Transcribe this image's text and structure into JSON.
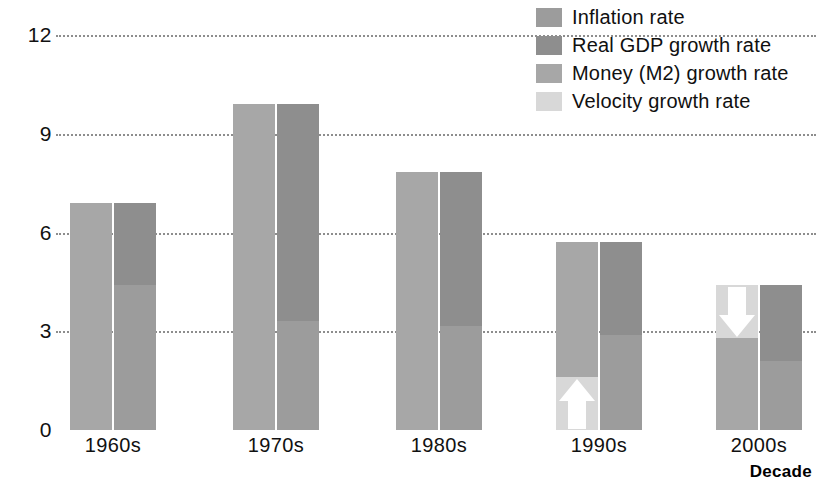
{
  "chart_data": {
    "type": "bar",
    "title": "",
    "subtitle": "",
    "xlabel": "Decade",
    "ylabel": "",
    "categories": [
      "1960s",
      "1970s",
      "1980s",
      "1990s",
      "2000s"
    ],
    "ylim": [
      0,
      12
    ],
    "yticks": [
      0,
      3,
      6,
      9,
      12
    ],
    "ytick_labels": [
      "0",
      "3",
      "6",
      "9",
      "12"
    ],
    "grid": true,
    "grid_style": "dotted horizontal",
    "legend_position": "top-right",
    "note": "Paired stacked bars per decade. Left bar = Money (M2) growth rate, optionally split with Velocity growth rate. Right bar = Real GDP growth rate stacked on Inflation rate.",
    "series": [
      {
        "name": "Money (M2) growth rate",
        "color": "#a7a7a7",
        "bar": "left",
        "values": [
          6.9,
          9.9,
          7.85,
          5.7,
          4.4
        ]
      },
      {
        "name": "Velocity growth rate",
        "color": "#d8d8d8",
        "bar": "left",
        "values": [
          0,
          0,
          0,
          1.6,
          1.6
        ],
        "placement": [
          "none",
          "none",
          "none",
          "bottom",
          "top"
        ],
        "arrows": [
          "none",
          "none",
          "none",
          "up",
          "down"
        ]
      },
      {
        "name": "Inflation rate",
        "color": "#9c9c9c",
        "bar": "right",
        "stack": "bottom",
        "values": [
          4.4,
          3.3,
          3.15,
          2.9,
          2.1
        ]
      },
      {
        "name": "Real GDP growth rate",
        "color": "#8e8e8e",
        "bar": "right",
        "stack": "top",
        "values": [
          2.5,
          6.6,
          4.7,
          2.8,
          2.3
        ]
      }
    ],
    "right_bar_totals": [
      6.9,
      9.9,
      7.85,
      5.7,
      4.4
    ]
  },
  "legend": {
    "items": [
      {
        "label": "Inflation rate",
        "color": "#9c9c9c"
      },
      {
        "label": "Real GDP growth rate",
        "color": "#8e8e8e"
      },
      {
        "label": "Money (M2) growth rate",
        "color": "#a7a7a7"
      },
      {
        "label": "Velocity growth rate",
        "color": "#d8d8d8"
      }
    ]
  },
  "axis": {
    "x_title": "Decade"
  },
  "colors": {
    "inflation": "#9c9c9c",
    "real_gdp": "#8e8e8e",
    "money_m2": "#a7a7a7",
    "velocity": "#d8d8d8",
    "gridline": "#8d8d8d",
    "text": "#111111",
    "background": "#ffffff"
  }
}
